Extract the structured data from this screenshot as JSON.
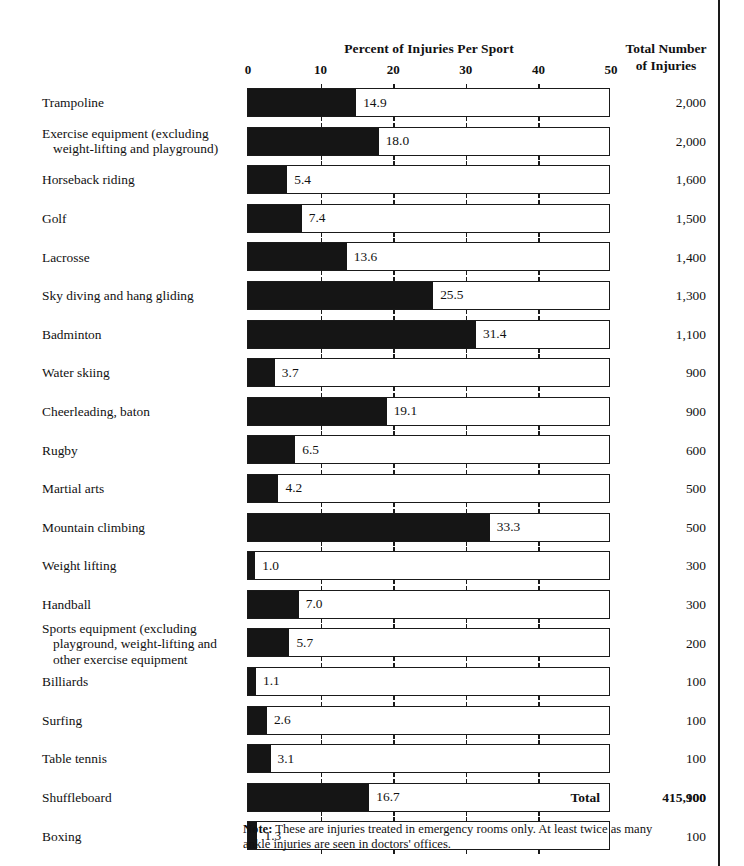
{
  "header": {
    "axis_title": "Percent of Injuries Per Sport",
    "totals_title_line1": "Total Number",
    "totals_title_line2": "of Injuries"
  },
  "footer": {
    "total_label": "Total",
    "total_value": "415,900",
    "note_prefix": "Note:",
    "note_text": " These are injuries treated in emergency rooms only. At least twice as many ankle injuries are seen in doctors' offices."
  },
  "chart_data": {
    "type": "bar",
    "orientation": "horizontal",
    "title": "Percent of Injuries Per Sport",
    "xlabel": "Percent of Injuries Per Sport",
    "ylabel": "",
    "xlim": [
      0,
      50
    ],
    "xticks": [
      0,
      10,
      20,
      30,
      40,
      50
    ],
    "xtick_labels": [
      "0",
      "10",
      "20",
      "30",
      "40",
      "50"
    ],
    "grid": false,
    "legend": "none",
    "bar_color": "#151515",
    "track_color": "#ffffff",
    "border_color": "#1a1a1a",
    "value_column_header": "Total Number of Injuries",
    "total_injuries": "415,900",
    "categories": [
      "Trampoline",
      "Exercise equipment (excluding weight-lifting and playground)",
      "Horseback riding",
      "Golf",
      "Lacrosse",
      "Sky diving and hang gliding",
      "Badminton",
      "Water skiing",
      "Cheerleading, baton",
      "Rugby",
      "Martial arts",
      "Mountain climbing",
      "Weight lifting",
      "Handball",
      "Sports equipment (excluding playground, weight-lifting and other exercise equipment",
      "Billiards",
      "Surfing",
      "Table tennis",
      "Shuffleboard",
      "Boxing"
    ],
    "values": [
      14.9,
      18.0,
      5.4,
      7.4,
      13.6,
      25.5,
      31.4,
      3.7,
      19.1,
      6.5,
      4.2,
      33.3,
      1.0,
      7.0,
      5.7,
      1.1,
      2.6,
      3.1,
      16.7,
      1.3
    ],
    "value_labels": [
      "14.9",
      "18.0",
      "5.4",
      "7.4",
      "13.6",
      "25.5",
      "31.4",
      "3.7",
      "19.1",
      "6.5",
      "4.2",
      "33.3",
      "1.0",
      "7.0",
      "5.7",
      "1.1",
      "2.6",
      "3.1",
      "16.7",
      "1.3"
    ],
    "totals": [
      2000,
      2000,
      1600,
      1500,
      1400,
      1300,
      1100,
      900,
      900,
      600,
      500,
      500,
      300,
      300,
      200,
      100,
      100,
      100,
      100,
      100
    ],
    "total_labels": [
      "2,000",
      "2,000",
      "1,600",
      "1,500",
      "1,400",
      "1,300",
      "1,100",
      "900",
      "900",
      "600",
      "500",
      "500",
      "300",
      "300",
      "200",
      "100",
      "100",
      "100",
      "100",
      "100"
    ]
  },
  "rows": [
    {
      "label": "Trampoline",
      "label_line2": "",
      "value": 14.9,
      "value_label": "14.9",
      "total_label": "2,000"
    },
    {
      "label": "Exercise equipment (excluding",
      "label_line2": "weight-lifting and playground)",
      "value": 18.0,
      "value_label": "18.0",
      "total_label": "2,000"
    },
    {
      "label": "Horseback riding",
      "label_line2": "",
      "value": 5.4,
      "value_label": "5.4",
      "total_label": "1,600"
    },
    {
      "label": "Golf",
      "label_line2": "",
      "value": 7.4,
      "value_label": "7.4",
      "total_label": "1,500"
    },
    {
      "label": "Lacrosse",
      "label_line2": "",
      "value": 13.6,
      "value_label": "13.6",
      "total_label": "1,400"
    },
    {
      "label": "Sky diving and hang gliding",
      "label_line2": "",
      "value": 25.5,
      "value_label": "25.5",
      "total_label": "1,300"
    },
    {
      "label": "Badminton",
      "label_line2": "",
      "value": 31.4,
      "value_label": "31.4",
      "total_label": "1,100"
    },
    {
      "label": "Water skiing",
      "label_line2": "",
      "value": 3.7,
      "value_label": "3.7",
      "total_label": "900"
    },
    {
      "label": "Cheerleading, baton",
      "label_line2": "",
      "value": 19.1,
      "value_label": "19.1",
      "total_label": "900"
    },
    {
      "label": "Rugby",
      "label_line2": "",
      "value": 6.5,
      "value_label": "6.5",
      "total_label": "600"
    },
    {
      "label": "Martial arts",
      "label_line2": "",
      "value": 4.2,
      "value_label": "4.2",
      "total_label": "500"
    },
    {
      "label": "Mountain climbing",
      "label_line2": "",
      "value": 33.3,
      "value_label": "33.3",
      "total_label": "500"
    },
    {
      "label": "Weight lifting",
      "label_line2": "",
      "value": 1.0,
      "value_label": "1.0",
      "total_label": "300"
    },
    {
      "label": "Handball",
      "label_line2": "",
      "value": 7.0,
      "value_label": "7.0",
      "total_label": "300"
    },
    {
      "label": "Sports equipment (excluding",
      "label_line2": "playground, weight-lifting and",
      "label_line3": "other exercise equipment",
      "value": 5.7,
      "value_label": "5.7",
      "total_label": "200"
    },
    {
      "label": "Billiards",
      "label_line2": "",
      "value": 1.1,
      "value_label": "1.1",
      "total_label": "100"
    },
    {
      "label": "Surfing",
      "label_line2": "",
      "value": 2.6,
      "value_label": "2.6",
      "total_label": "100"
    },
    {
      "label": "Table tennis",
      "label_line2": "",
      "value": 3.1,
      "value_label": "3.1",
      "total_label": "100"
    },
    {
      "label": "Shuffleboard",
      "label_line2": "",
      "value": 16.7,
      "value_label": "16.7",
      "total_label": "100"
    },
    {
      "label": "Boxing",
      "label_line2": "",
      "value": 1.3,
      "value_label": "1.3",
      "total_label": "100"
    }
  ]
}
